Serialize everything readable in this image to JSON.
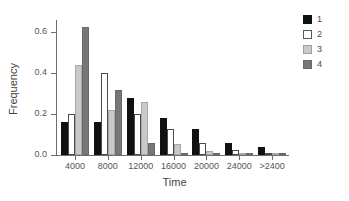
{
  "chart_data": {
    "type": "bar",
    "title": "",
    "xlabel": "Time",
    "ylabel": "Frequency",
    "categories": [
      "4000",
      "8000",
      "12000",
      "16000",
      "20000",
      "24000",
      ">2400"
    ],
    "ylim": [
      0.0,
      0.65
    ],
    "yticks": [
      0.0,
      0.2,
      0.4,
      0.6
    ],
    "ytick_labels": [
      "0.0",
      "0.2",
      "0.4",
      "0.6"
    ],
    "grid": false,
    "legend_position": "right",
    "series": [
      {
        "name": "1",
        "color": "#111111",
        "values": [
          0.16,
          0.16,
          0.28,
          0.18,
          0.125,
          0.06,
          0.04
        ]
      },
      {
        "name": "2",
        "color": "#ffffff",
        "values": [
          0.2,
          0.4,
          0.2,
          0.125,
          0.06,
          0.025,
          0.005
        ]
      },
      {
        "name": "3",
        "color": "#c9c9c9",
        "values": [
          0.44,
          0.22,
          0.26,
          0.055,
          0.02,
          0.004,
          0.002
        ]
      },
      {
        "name": "4",
        "color": "#777777",
        "values": [
          0.625,
          0.32,
          0.06,
          0.005,
          0.003,
          0.002,
          0.001
        ]
      }
    ]
  },
  "legend": {
    "entries": [
      {
        "label": "1"
      },
      {
        "label": "2"
      },
      {
        "label": "3"
      },
      {
        "label": "4"
      }
    ]
  }
}
